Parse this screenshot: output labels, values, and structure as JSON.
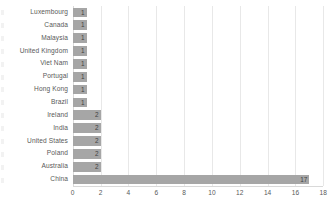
{
  "chart_data": {
    "type": "bar",
    "orientation": "horizontal",
    "title": "",
    "subtitle": "",
    "xlabel": "",
    "ylabel": "",
    "categories": [
      "Luxembourg",
      "Canada",
      "Malaysia",
      "United Kingdom",
      "Viet Nam",
      "Portugal",
      "Hong Kong",
      "Brazil",
      "Ireland",
      "India",
      "United States",
      "Poland",
      "Australia",
      "China"
    ],
    "values": [
      1,
      1,
      1,
      1,
      1,
      1,
      1,
      1,
      2,
      2,
      2,
      2,
      2,
      17
    ],
    "data_labels": [
      "1",
      "1",
      "1",
      "1",
      "1",
      "1",
      "1",
      "1",
      "2",
      "2",
      "2",
      "2",
      "2",
      "17"
    ],
    "xlim": [
      0,
      18
    ],
    "xticks": [
      0,
      2,
      4,
      6,
      8,
      10,
      12,
      14,
      16,
      18
    ],
    "xtick_labels": [
      "0",
      "2",
      "4",
      "6",
      "8",
      "10",
      "12",
      "14",
      "16",
      "18"
    ],
    "grid": "vertical",
    "legend": "none",
    "bar_color": "#a6a6a6",
    "gridline_color": "#e8e8e8",
    "axis_color": "#d9d9d9",
    "label_color": "#595959",
    "value_label_color": "#3f3f3f"
  }
}
